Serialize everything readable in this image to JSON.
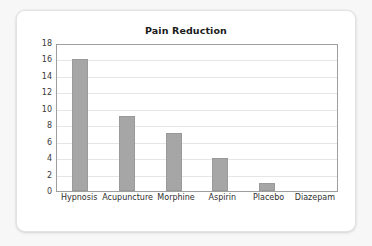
{
  "card": {
    "background_color": "#ffffff",
    "page_background_color": "#f7f7f7"
  },
  "chart_data": {
    "type": "bar",
    "title": "Pain Reduction",
    "xlabel": "",
    "ylabel": "",
    "categories": [
      "Hypnosis",
      "Acupuncture",
      "Morphine",
      "Aspirin",
      "Placebo",
      "Diazepam"
    ],
    "values": [
      16,
      9.1,
      7.1,
      4,
      1,
      0
    ],
    "ylim": [
      0,
      18
    ],
    "ytick_step": 2,
    "yticks": [
      "0",
      "2",
      "4",
      "6",
      "8",
      "10",
      "12",
      "14",
      "16",
      "18"
    ],
    "grid": "horizontal",
    "legend": "none",
    "bar_color": "#a6a6a6",
    "axis_color": "#9e9e9e",
    "gridline_color": "#e6e6e6"
  }
}
